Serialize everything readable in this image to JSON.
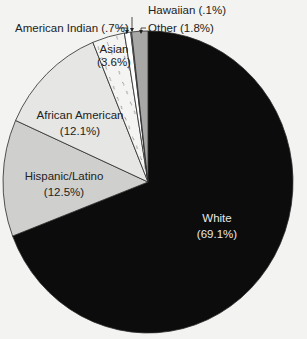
{
  "chart_data": {
    "type": "pie",
    "title": "",
    "start_angle_deg": 0,
    "direction": "clockwise",
    "slices": [
      {
        "label": "White",
        "value_label": "(69.1%)",
        "value": 69.1,
        "color": "#0c0c0c",
        "pattern": "none",
        "text_color": "#e8e8e8"
      },
      {
        "label": "Hispanic/Latino",
        "value_label": "(12.5%)",
        "value": 12.5,
        "color": "#cfcfcd",
        "pattern": "none",
        "text_color": "#222222"
      },
      {
        "label": "African American",
        "value_label": "(12.1%)",
        "value": 12.1,
        "color": "#e6e6e4",
        "pattern": "none",
        "text_color": "#222222"
      },
      {
        "label": "Asian",
        "value_label": "(3.6%)",
        "value": 3.6,
        "color": "#f4f4f2",
        "pattern": "dashes",
        "text_color": "#222222"
      },
      {
        "label": "American Indian",
        "value_label": "(.7%)",
        "value": 0.7,
        "color": "#ffffff",
        "pattern": "none",
        "text_color": "#222222"
      },
      {
        "label": "Hawaiian",
        "value_label": "(.1%)",
        "value": 0.1,
        "color": "#ffffff",
        "pattern": "none",
        "text_color": "#222222"
      },
      {
        "label": "Other",
        "value_label": "(1.8%)",
        "value": 1.8,
        "color": "#a8a8a6",
        "pattern": "none",
        "text_color": "#222222"
      }
    ],
    "legend": "none",
    "annotations": [
      {
        "text": "Hawaiian (.1%)",
        "x": 150,
        "y": 14
      },
      {
        "text": "American Indian (.7%)",
        "x": 15,
        "y": 33
      },
      {
        "text": "Other (1.8%)",
        "x": 148,
        "y": 33
      }
    ]
  },
  "inside_labels": {
    "white": {
      "name": "White",
      "pct": "(69.1%)"
    },
    "hispanic": {
      "name": "Hispanic/Latino",
      "pct": "(12.5%)"
    },
    "african_american": {
      "name": "African American",
      "pct": "(12.1%)"
    },
    "asian": {
      "name": "Asian",
      "pct": "(3.6%)"
    }
  },
  "callouts": {
    "hawaiian": "Hawaiian (.1%)",
    "american_indian": "American Indian (.7%)",
    "other": "Other (1.8%)"
  }
}
